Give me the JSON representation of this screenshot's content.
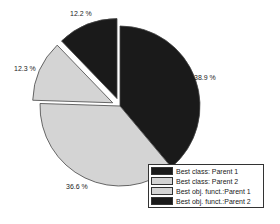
{
  "chart_data": {
    "type": "pie",
    "title": "",
    "categories": [
      "Best class: Parent 1",
      "Best class: Parent 2",
      "Best obj. funct.:Parent 1",
      "Best obj. funct.:Parent 2"
    ],
    "values": [
      38.9,
      36.6,
      12.3,
      12.2
    ],
    "labels": [
      "38.9 %",
      "36.6 %",
      "12.3 %",
      "12.2 %"
    ],
    "colors": [
      "#1a1a1a",
      "#d4d4d4",
      "#d4d4d4",
      "#1a1a1a"
    ],
    "exploded": [
      false,
      false,
      true,
      true
    ],
    "start_angle": "12 o'clock",
    "direction": "clockwise",
    "legend_position": "bottom-right"
  },
  "labels": {
    "s0": "38.9 %",
    "s1": "36.6 %",
    "s2": "12.3 %",
    "s3": "12.2 %"
  },
  "legend": [
    {
      "label": "Best class: Parent 1",
      "color": "#1a1a1a"
    },
    {
      "label": "Best class: Parent 2",
      "color": "#d4d4d4"
    },
    {
      "label": "Best obj. funct.:Parent 1",
      "color": "#d4d4d4"
    },
    {
      "label": "Best obj. funct.:Parent 2",
      "color": "#1a1a1a"
    }
  ]
}
